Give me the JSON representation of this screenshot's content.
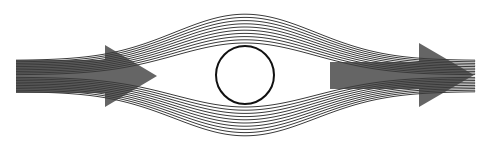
{
  "diagram": {
    "canvas": {
      "width": 487,
      "height": 152
    },
    "colors": {
      "background": "#ffffff",
      "streamline": "#3a3a3a",
      "cylinder": "#111111",
      "arrow": "#4a4a4a"
    },
    "cylinder": {
      "cx": 245,
      "cy": 75,
      "r": 29
    },
    "streamlines": {
      "count_above": 10,
      "count_below": 10,
      "x_start": 16,
      "x_end": 475,
      "far_field_center_y": 76,
      "far_field_spacing": 1.6,
      "mid_spacing_near": 3.2,
      "mid_spacing_far": 3.0,
      "cylinder_clearance": 3
    },
    "arrows": [
      {
        "name": "inflow-arrow",
        "body_x0": 16,
        "body_x1": 105,
        "body_y0": 60,
        "body_y1": 93,
        "head_x": 105,
        "head_top": 45,
        "head_bottom": 107,
        "tip_x": 157,
        "tip_y": 76
      },
      {
        "name": "outflow-arrow",
        "body_x0": 330,
        "body_x1": 419,
        "body_y0": 62,
        "body_y1": 89,
        "head_x": 419,
        "head_top": 43,
        "head_bottom": 107,
        "tip_x": 474,
        "tip_y": 75
      }
    ]
  }
}
